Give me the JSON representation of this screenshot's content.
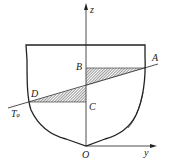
{
  "diagram": {
    "type": "ship-cross-section",
    "axes": {
      "z_label": "z",
      "y_label": "y",
      "origin_label": "O"
    },
    "points": {
      "A": "A",
      "B": "B",
      "C": "C",
      "D": "D"
    },
    "waterline": {
      "label": "T",
      "subscript": "φ"
    },
    "colors": {
      "stroke": "#222222",
      "hatch": "#555555",
      "background": "#ffffff"
    }
  }
}
